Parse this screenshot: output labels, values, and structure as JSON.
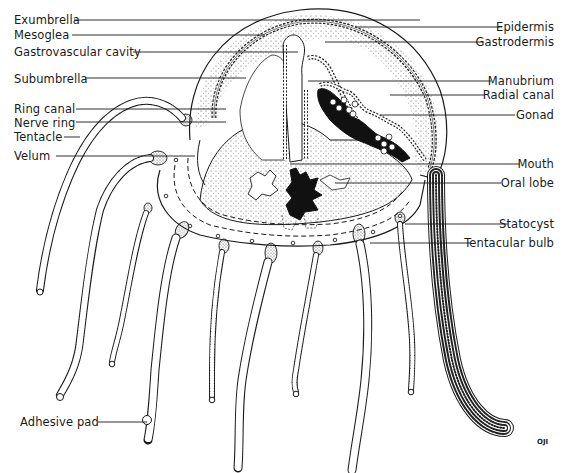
{
  "diagram": {
    "labels_left": [
      {
        "text": "Exumbrella",
        "x": 14,
        "y": 14,
        "lineX1": 74,
        "lineX2": 420,
        "lineY": 20
      },
      {
        "text": "Mesoglea",
        "x": 14,
        "y": 29,
        "lineX1": 72,
        "lineX2": 265,
        "lineY": 35
      },
      {
        "text": "Gastrovascular cavity",
        "x": 14,
        "y": 46,
        "lineX1": 133,
        "lineX2": 298,
        "lineY": 52
      },
      {
        "text": "Subumbrella",
        "x": 14,
        "y": 73,
        "lineX1": 85,
        "lineX2": 246,
        "lineY": 78
      },
      {
        "text": "Ring canal",
        "x": 14,
        "y": 103,
        "lineX1": 76,
        "lineX2": 226,
        "lineY": 109
      },
      {
        "text": "Nerve ring",
        "x": 14,
        "y": 117,
        "lineX1": 76,
        "lineX2": 226,
        "lineY": 122
      },
      {
        "text": "Tentacle",
        "x": 14,
        "y": 131,
        "lineX1": 64,
        "lineX2": 80,
        "lineY": 137
      },
      {
        "text": "Velum",
        "x": 14,
        "y": 150,
        "lineX1": 56,
        "lineX2": 195,
        "lineY": 156
      },
      {
        "text": "Adhesive pad",
        "x": 20,
        "y": 416,
        "lineX1": 98,
        "lineX2": 147,
        "lineY": 422
      }
    ],
    "labels_right": [
      {
        "text": "Epidermis",
        "right": 18,
        "y": 21,
        "lineX1": 355,
        "lineX2": 502,
        "lineY": 27
      },
      {
        "text": "Gastrodermis",
        "right": 18,
        "y": 36,
        "lineX1": 325,
        "lineX2": 483,
        "lineY": 42
      },
      {
        "text": "Manubrium",
        "right": 18,
        "y": 75,
        "lineX1": 308,
        "lineX2": 491,
        "lineY": 81
      },
      {
        "text": "Radial canal",
        "right": 18,
        "y": 89,
        "lineX1": 390,
        "lineX2": 485,
        "lineY": 95
      },
      {
        "text": "Gonad",
        "right": 18,
        "y": 109,
        "lineX1": 380,
        "lineX2": 515,
        "lineY": 115
      },
      {
        "text": "Mouth",
        "right": 18,
        "y": 158,
        "lineX1": 290,
        "lineX2": 520,
        "lineY": 164
      },
      {
        "text": "Oral lobe",
        "right": 18,
        "y": 177,
        "lineX1": 335,
        "lineX2": 501,
        "lineY": 183
      },
      {
        "text": "Statocyst",
        "right": 18,
        "y": 218,
        "lineX1": 405,
        "lineX2": 508,
        "lineY": 224
      },
      {
        "text": "Tentacular bulb",
        "right": 18,
        "y": 237,
        "lineX1": 370,
        "lineX2": 471,
        "lineY": 243
      }
    ],
    "credit": "OJI"
  },
  "colors": {
    "ink": "#1a1a1a",
    "stipple": "#555555",
    "background": "#ffffff",
    "gonad_dark": "#111111"
  }
}
